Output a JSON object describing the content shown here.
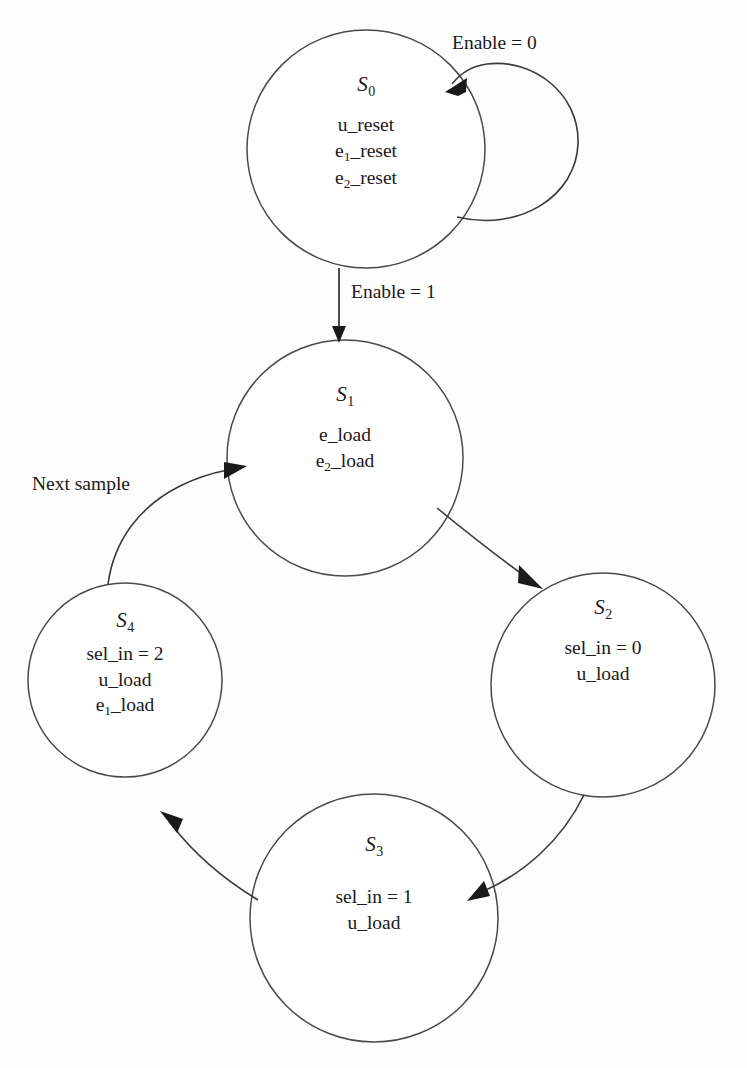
{
  "diagram": {
    "kind": "state-transition-diagram",
    "background_color": "#fdfdfd",
    "stroke_color": "#3a3a3a",
    "states": [
      {
        "id": "S0",
        "name": "S",
        "subscript": "0",
        "cx": 366,
        "cy": 149,
        "r": 119,
        "actions": [
          {
            "base": "u_reset",
            "sub": "",
            "tail": ""
          },
          {
            "base": "e",
            "sub": "1",
            "tail": "_reset"
          },
          {
            "base": "e",
            "sub": "2",
            "tail": "_reset"
          }
        ]
      },
      {
        "id": "S1",
        "name": "S",
        "subscript": "1",
        "cx": 345,
        "cy": 458,
        "r": 118,
        "actions": [
          {
            "base": "e_load",
            "sub": "",
            "tail": ""
          },
          {
            "base": "e",
            "sub": "2",
            "tail": "_load"
          }
        ]
      },
      {
        "id": "S2",
        "name": "S",
        "subscript": "2",
        "cx": 603,
        "cy": 685,
        "r": 112,
        "actions": [
          {
            "base": "sel_in = 0",
            "sub": "",
            "tail": ""
          },
          {
            "base": "u_load",
            "sub": "",
            "tail": ""
          }
        ]
      },
      {
        "id": "S3",
        "name": "S",
        "subscript": "3",
        "cx": 374,
        "cy": 918,
        "r": 124,
        "actions": [
          {
            "base": "sel_in = 1",
            "sub": "",
            "tail": ""
          },
          {
            "base": "u_load",
            "sub": "",
            "tail": ""
          }
        ]
      },
      {
        "id": "S4",
        "name": "S",
        "subscript": "4",
        "cx": 125,
        "cy": 680,
        "r": 97,
        "actions": [
          {
            "base": "sel_in = 2",
            "sub": "",
            "tail": ""
          },
          {
            "base": "u_load",
            "sub": "",
            "tail": ""
          },
          {
            "base": "e",
            "sub": "1",
            "tail": "_load"
          }
        ]
      }
    ],
    "transitions": [
      {
        "id": "t-self-s0",
        "from": "S0",
        "to": "S0",
        "label": "Enable = 0"
      },
      {
        "id": "t-s0-s1",
        "from": "S0",
        "to": "S1",
        "label": "Enable = 1"
      },
      {
        "id": "t-s1-s2",
        "from": "S1",
        "to": "S2",
        "label": ""
      },
      {
        "id": "t-s2-s3",
        "from": "S2",
        "to": "S3",
        "label": ""
      },
      {
        "id": "t-s3-s4",
        "from": "S3",
        "to": "S4",
        "label": ""
      },
      {
        "id": "t-s4-s1",
        "from": "S4",
        "to": "S1",
        "label": "Next sample"
      }
    ],
    "labels": {
      "enable_0": "Enable = 0",
      "enable_1": "Enable = 1",
      "next_sample": "Next sample"
    }
  }
}
